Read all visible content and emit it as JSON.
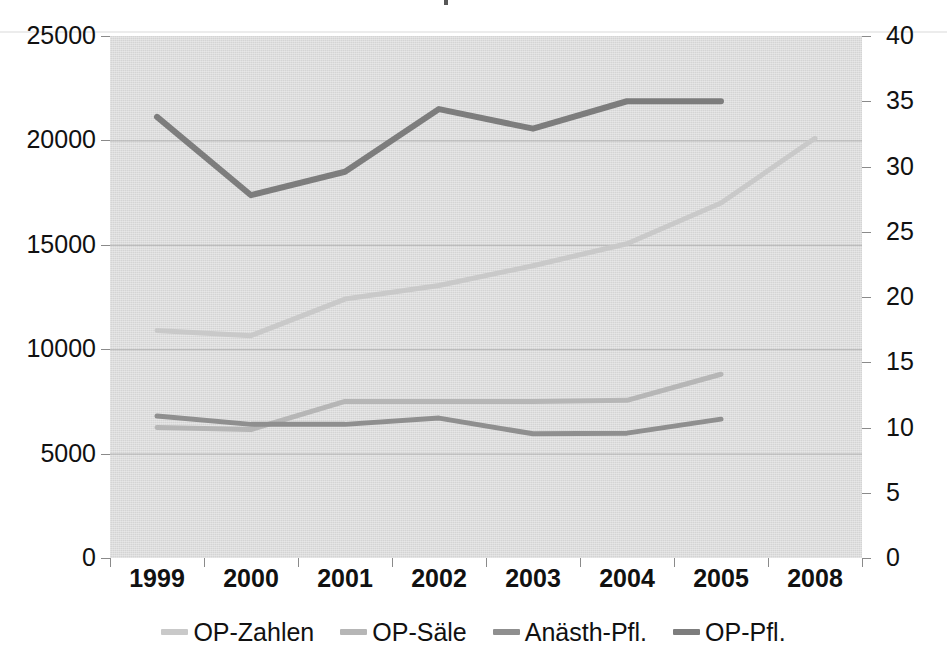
{
  "chart_data": {
    "type": "line",
    "title": "",
    "xlabel": "",
    "ylabel": "",
    "categories": [
      "1999",
      "2000",
      "2001",
      "2002",
      "2003",
      "2004",
      "2005",
      "2008"
    ],
    "grid": true,
    "legend_position": "bottom",
    "axes": {
      "left": {
        "label": "",
        "ylim": [
          0,
          25000
        ],
        "ticks": [
          "0",
          "5000",
          "10000",
          "15000",
          "20000",
          "25000"
        ],
        "tick_values": [
          0,
          5000,
          10000,
          15000,
          20000,
          25000
        ]
      },
      "right": {
        "label": "",
        "ylim": [
          0,
          40
        ],
        "ticks": [
          "0",
          "5",
          "10",
          "15",
          "20",
          "25",
          "30",
          "35",
          "40"
        ],
        "tick_values": [
          0,
          5,
          10,
          15,
          20,
          25,
          30,
          35,
          40
        ]
      }
    },
    "series": [
      {
        "name": "OP-Zahlen",
        "axis": "left",
        "color": "#c9c9c9",
        "width": 5,
        "x": [
          "1999",
          "2000",
          "2001",
          "2002",
          "2003",
          "2004",
          "2005",
          "2008"
        ],
        "values": [
          10900,
          10650,
          12400,
          13050,
          14000,
          15050,
          17000,
          20100
        ]
      },
      {
        "name": "OP-Säle",
        "axis": "left",
        "color": "#b6b6b6",
        "width": 5,
        "x": [
          "1999",
          "2000",
          "2001",
          "2002",
          "2003",
          "2004",
          "2005"
        ],
        "values": [
          6250,
          6150,
          7500,
          7500,
          7500,
          7550,
          8800
        ]
      },
      {
        "name": "Anästh-Pfl.",
        "axis": "left",
        "color": "#8f8f8f",
        "width": 5,
        "x": [
          "1999",
          "2000",
          "2001",
          "2002",
          "2003",
          "2004",
          "2005"
        ],
        "values": [
          6800,
          6400,
          6400,
          6700,
          5950,
          5980,
          6650
        ]
      },
      {
        "name": "OP-Pfl.",
        "axis": "right",
        "color": "#7d7d7d",
        "width": 6,
        "x": [
          "1999",
          "2000",
          "2001",
          "2002",
          "2003",
          "2004",
          "2005"
        ],
        "values": [
          33.8,
          27.8,
          29.6,
          34.4,
          32.9,
          35.0,
          35.0
        ]
      }
    ]
  },
  "legend": {
    "items": [
      {
        "label": "OP-Zahlen",
        "color": "#c9c9c9"
      },
      {
        "label": "OP-Säle",
        "color": "#b6b6b6"
      },
      {
        "label": "Anästh-Pfl.",
        "color": "#8f8f8f"
      },
      {
        "label": "OP-Pfl.",
        "color": "#7d7d7d"
      }
    ]
  },
  "colors": {
    "plot_background": "#d4d4d4",
    "gridline": "#9a9a9a",
    "axis_text": "#111111",
    "page_background": "#ffffff"
  }
}
